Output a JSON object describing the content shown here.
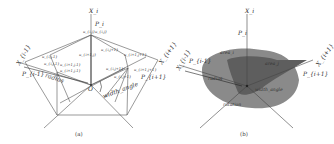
{
  "panels": [
    {
      "id": "a",
      "caption": "(a)",
      "axes": {
        "top": "X_i",
        "left": "X_{i-1}",
        "right": "X_{i+1}"
      },
      "points": {
        "top": "P_i",
        "left": "P_{i-1}",
        "right": "P_{i+1}"
      },
      "origin": "O",
      "labels": {
        "radius": "radius",
        "width_angle": "width_angle",
        "u_top_a": "u_{i,j}",
        "u_top_b": "u_{i,j}",
        "u_l1": "u_{i,j-1}",
        "u_l2": "u_{i,j-1}",
        "u_m1": "u_{i+1,j}",
        "u_m2": "u_{i,j+1}",
        "u_m3": "u_{i+1,j-1}",
        "u_m4": "u_{i+1,j-1}",
        "u_r1": "u_{i+1,j+1}",
        "u_r2": "u_{i,j+1}",
        "u_r3": "u_{i,j+1}",
        "u_r4": "u_{i+1,j+1}"
      }
    },
    {
      "id": "b",
      "caption": "(b)",
      "axes": {
        "top": "X_i",
        "left": "X_{i-1}",
        "right": "X_{i+1}"
      },
      "points": {
        "top": "P_i",
        "left": "P_{i-1}",
        "right": "P_{i+1}"
      },
      "labels": {
        "area_outer": "area_i",
        "area_inner": "area_j",
        "radius": "radius",
        "width_angle": "width_angle",
        "rotation": "rotation"
      },
      "colors": {
        "outer_fill": "#8a8a8a",
        "inner_fill": "#5e5e5e"
      }
    }
  ]
}
